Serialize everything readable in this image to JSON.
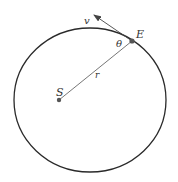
{
  "diagram": {
    "colors": {
      "orbit": "#2a2a2a",
      "line": "#555555",
      "point": "#555555",
      "label": "#333333",
      "background": "#ffffff"
    },
    "labels": {
      "sun": "S",
      "body": "E",
      "velocity": "v",
      "radius": "r",
      "angle": "θ"
    },
    "elements": {
      "orbit": "ellipse",
      "radius_vector": "line from S to E",
      "velocity_vector": "arrow tangent at E",
      "angle_marker": "angle between r and v at E"
    }
  }
}
